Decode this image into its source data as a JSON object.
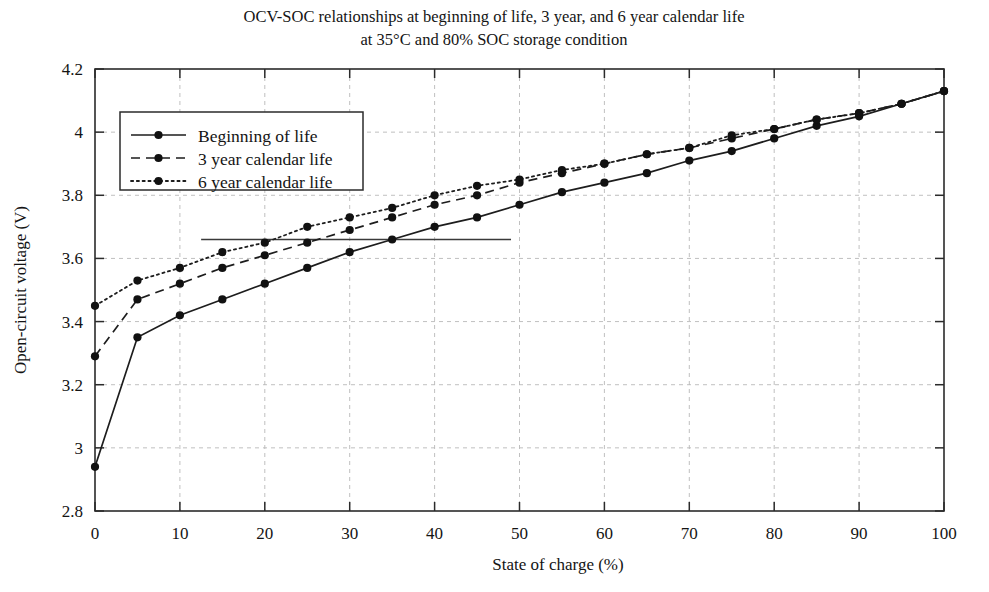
{
  "figure": {
    "title_line1": "OCV-SOC relationships at beginning of life, 3 year, and 6 year calendar life",
    "title_line2": "at 35°C and 80% SOC storage condition"
  },
  "chart_data": {
    "type": "line",
    "title": "OCV-SOC relationships at beginning of life, 3 year, and 6 year calendar life at 35°C and 80% SOC storage condition",
    "xlabel": "State of charge (%)",
    "ylabel": "Open-circuit voltage (V)",
    "xlim": [
      0,
      100
    ],
    "ylim": [
      2.8,
      4.2
    ],
    "xticks": [
      0,
      10,
      20,
      30,
      40,
      50,
      60,
      70,
      80,
      90,
      100
    ],
    "yticks": [
      2.8,
      3,
      3.2,
      3.4,
      3.6,
      3.8,
      4,
      4.2
    ],
    "xtick_labels": [
      "0",
      "10",
      "20",
      "30",
      "40",
      "50",
      "60",
      "70",
      "80",
      "90",
      "100"
    ],
    "ytick_labels": [
      "2.8",
      "3",
      "3.2",
      "3.4",
      "3.6",
      "3.8",
      "4",
      "4.2"
    ],
    "grid": true,
    "legend_position": "upper left",
    "marker": "filled-circle",
    "x": [
      0,
      5,
      10,
      15,
      20,
      25,
      30,
      35,
      40,
      45,
      50,
      55,
      60,
      65,
      70,
      75,
      80,
      85,
      90,
      95,
      100
    ],
    "series": [
      {
        "name": "Beginning of life",
        "linestyle": "solid",
        "color": "#1d1d1d",
        "values": [
          2.94,
          3.35,
          3.42,
          3.47,
          3.52,
          3.57,
          3.62,
          3.66,
          3.7,
          3.73,
          3.77,
          3.81,
          3.84,
          3.87,
          3.91,
          3.94,
          3.98,
          4.02,
          4.05,
          4.09,
          4.13
        ]
      },
      {
        "name": "3 year calendar life",
        "linestyle": "dashed",
        "color": "#1d1d1d",
        "values": [
          3.29,
          3.47,
          3.52,
          3.57,
          3.61,
          3.65,
          3.69,
          3.73,
          3.77,
          3.8,
          3.84,
          3.87,
          3.9,
          3.93,
          3.95,
          3.98,
          4.01,
          4.04,
          4.06,
          4.09,
          4.13
        ]
      },
      {
        "name": "6 year calendar life",
        "linestyle": "dotted",
        "color": "#1d1d1d",
        "values": [
          3.45,
          3.53,
          3.57,
          3.62,
          3.65,
          3.7,
          3.73,
          3.76,
          3.8,
          3.83,
          3.85,
          3.88,
          3.9,
          3.93,
          3.95,
          3.99,
          4.01,
          4.04,
          4.06,
          4.09,
          4.13
        ]
      }
    ],
    "annotations": [
      {
        "type": "horizontal-line",
        "y": 3.66,
        "x_start": 12.5,
        "x_end": 49.0,
        "color": "#3a3a3a"
      }
    ],
    "legend": [
      {
        "label": "Beginning of life",
        "linestyle": "solid"
      },
      {
        "label": "3 year calendar life",
        "linestyle": "dashed"
      },
      {
        "label": "6 year calendar life",
        "linestyle": "dotted"
      }
    ]
  }
}
